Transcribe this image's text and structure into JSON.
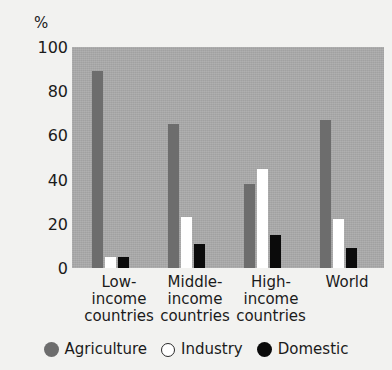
{
  "chart_data": {
    "type": "bar",
    "title": "",
    "subtitle": "",
    "xlabel": "",
    "ylabel": "%",
    "ylim": [
      0,
      100
    ],
    "yticks": [
      0,
      20,
      40,
      60,
      80,
      100
    ],
    "ytick_labels": [
      "0",
      "20",
      "40",
      "60",
      "80",
      "100"
    ],
    "grid": false,
    "legend_position": "bottom",
    "categories": [
      "Low-\nincome\ncountries",
      "Middle-\nincome\ncountries",
      "High-\nincome\ncountries",
      "World"
    ],
    "category_lines": [
      [
        "Low-",
        "income",
        "countries"
      ],
      [
        "Middle-",
        "income",
        "countries"
      ],
      [
        "High-",
        "income",
        "countries"
      ],
      [
        "World",
        "",
        ""
      ]
    ],
    "series": [
      {
        "name": "Agriculture",
        "color": "#6d6d6d",
        "values": [
          89,
          65,
          38,
          67
        ]
      },
      {
        "name": "Industry",
        "color": "#ffffff",
        "values": [
          5,
          23,
          45,
          22
        ]
      },
      {
        "name": "Domestic",
        "color": "#0b0b0b",
        "values": [
          5,
          11,
          15,
          9
        ]
      }
    ],
    "plot_background": "#a9a9a9",
    "figure_background": "#f2f2f0"
  },
  "axis": {
    "unit": "%",
    "tick_100": "100",
    "tick_80": "80",
    "tick_60": "60",
    "tick_40": "40",
    "tick_20": "20",
    "tick_0": "0"
  },
  "categories": {
    "g0_l0": "Low-",
    "g0_l1": "income",
    "g0_l2": "countries",
    "g1_l0": "Middle-",
    "g1_l1": "income",
    "g1_l2": "countries",
    "g2_l0": "High-",
    "g2_l1": "income",
    "g2_l2": "countries",
    "g3_l0": "World",
    "g3_l1": "",
    "g3_l2": ""
  },
  "legend": {
    "agriculture": "Agriculture",
    "industry": "Industry",
    "domestic": "Domestic"
  }
}
